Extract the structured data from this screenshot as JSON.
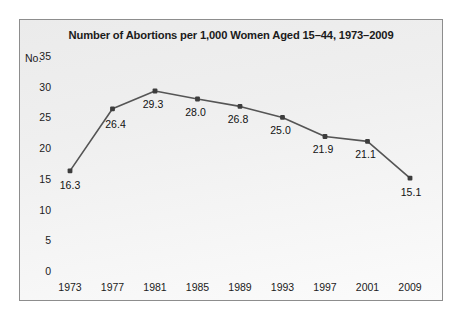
{
  "figure": {
    "title": "Number of Abortions per 1,000 Women Aged 15–44, 1973–2009",
    "frame_color": "#8d8d8d",
    "background_color": "#eeeeee"
  },
  "chart_data": {
    "type": "line",
    "title": "Number of Abortions per 1,000 Women Aged 15–44, 1973–2009",
    "xlabel": "",
    "ylabel": "No.",
    "categories": [
      "1973",
      "1977",
      "1981",
      "1985",
      "1989",
      "1993",
      "1997",
      "2001",
      "2009"
    ],
    "values": [
      16.3,
      26.4,
      29.3,
      28.0,
      26.8,
      25.0,
      21.9,
      21.1,
      15.1
    ],
    "point_labels": [
      "16.3",
      "26.4",
      "29.3",
      "28.0",
      "26.8",
      "25.0",
      "21.9",
      "21.1",
      "15.1"
    ],
    "ylim": [
      0,
      35
    ],
    "yticks": [
      35,
      30,
      25,
      20,
      15,
      10,
      5,
      0
    ],
    "ytick_labels": [
      "35",
      "30",
      "25",
      "20",
      "15",
      "10",
      "5",
      "0"
    ],
    "xtick_labels": [
      "1973",
      "1977",
      "1981",
      "1985",
      "1989",
      "1993",
      "1997",
      "2001",
      "2009"
    ],
    "grid": false,
    "legend": false,
    "line_color": "#555555",
    "marker_color": "#3d3d3d",
    "marker_shape": "square"
  }
}
